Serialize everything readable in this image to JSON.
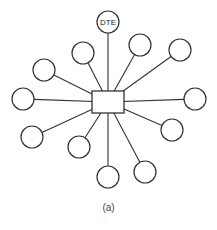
{
  "diagram": {
    "type": "star-topology",
    "hub": {
      "x": 92,
      "y": 91,
      "w": 32,
      "h": 22,
      "label": ""
    },
    "node_radius": 11,
    "stroke_color": "#333333",
    "nodes": [
      {
        "x": 108,
        "y": 22,
        "label": "DTE"
      },
      {
        "x": 83,
        "y": 53,
        "label": ""
      },
      {
        "x": 140,
        "y": 45,
        "label": ""
      },
      {
        "x": 180,
        "y": 50,
        "label": ""
      },
      {
        "x": 44,
        "y": 70,
        "label": ""
      },
      {
        "x": 23,
        "y": 99,
        "label": ""
      },
      {
        "x": 195,
        "y": 99,
        "label": ""
      },
      {
        "x": 172,
        "y": 130,
        "label": ""
      },
      {
        "x": 32,
        "y": 137,
        "label": ""
      },
      {
        "x": 79,
        "y": 147,
        "label": ""
      },
      {
        "x": 108,
        "y": 177,
        "label": ""
      },
      {
        "x": 145,
        "y": 172,
        "label": ""
      }
    ]
  },
  "caption": "(a)"
}
